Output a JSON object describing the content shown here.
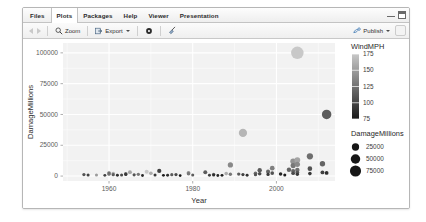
{
  "window": {
    "minimize_label": "minimize",
    "maximize_label": "maximize"
  },
  "tabs": [
    {
      "label": "Files",
      "active": false,
      "name": "tab-files"
    },
    {
      "label": "Plots",
      "active": true,
      "name": "tab-plots"
    },
    {
      "label": "Packages",
      "active": false,
      "name": "tab-packages"
    },
    {
      "label": "Help",
      "active": false,
      "name": "tab-help"
    },
    {
      "label": "Viewer",
      "active": false,
      "name": "tab-viewer"
    },
    {
      "label": "Presentation",
      "active": false,
      "name": "tab-presentation"
    }
  ],
  "toolbar": {
    "zoom_label": "Zoom",
    "export_label": "Export",
    "publish_label": "Publish",
    "icons": {
      "back": "left-arrow-icon",
      "forward": "right-arrow-icon",
      "zoom": "magnifier-icon",
      "export": "export-icon",
      "remove": "gear-icon",
      "clear": "broom-icon",
      "publish": "publish-icon"
    }
  },
  "chart_data": {
    "type": "scatter",
    "title": "",
    "xlabel": "Year",
    "ylabel": "DamageMillions",
    "xlim": [
      1949,
      2014
    ],
    "ylim": [
      -4000,
      108000
    ],
    "xticks": [
      1960,
      1980,
      2000
    ],
    "yticks": [
      0,
      25000,
      50000,
      75000,
      100000
    ],
    "ytick_labels": [
      "0",
      "25000",
      "50000",
      "75000",
      "100000"
    ],
    "xtick_labels": [
      "1960",
      "1980",
      "2000"
    ],
    "grid": true,
    "panel_background": "#f2f2f2",
    "grid_color": "#ffffff",
    "point_color_scale": "grey",
    "legends": [
      {
        "name": "colorbar",
        "title": "WindMPH",
        "type": "colorbar",
        "ticks": [
          175,
          150,
          125,
          100,
          75
        ],
        "tick_labels": [
          "175",
          "150",
          "125",
          "100",
          "75"
        ],
        "high_color": "#c8c8c8",
        "low_color": "#1a1a1a"
      },
      {
        "name": "size",
        "title": "DamageMillions",
        "type": "size",
        "breaks": [
          25000,
          50000,
          75000
        ],
        "break_labels": [
          "25000",
          "50000",
          "75000"
        ],
        "marker_color": "#161616"
      }
    ],
    "points": [
      {
        "x": 1954,
        "y": 1200,
        "wind": 110,
        "size": 1200
      },
      {
        "x": 1955,
        "y": 900,
        "wind": 100,
        "size": 900
      },
      {
        "x": 1957,
        "y": 800,
        "wind": 150,
        "size": 800
      },
      {
        "x": 1959,
        "y": 600,
        "wind": 100,
        "size": 600
      },
      {
        "x": 1960,
        "y": 1500,
        "wind": 140,
        "size": 1500
      },
      {
        "x": 1960,
        "y": 2400,
        "wind": 125,
        "size": 2400
      },
      {
        "x": 1961,
        "y": 2100,
        "wind": 160,
        "size": 2100
      },
      {
        "x": 1961,
        "y": 1100,
        "wind": 115,
        "size": 1100
      },
      {
        "x": 1962,
        "y": 700,
        "wind": 90,
        "size": 700
      },
      {
        "x": 1963,
        "y": 900,
        "wind": 105,
        "size": 900
      },
      {
        "x": 1964,
        "y": 1800,
        "wind": 120,
        "size": 1800
      },
      {
        "x": 1964,
        "y": 1300,
        "wind": 95,
        "size": 1300
      },
      {
        "x": 1965,
        "y": 3200,
        "wind": 155,
        "size": 3200
      },
      {
        "x": 1966,
        "y": 1000,
        "wind": 110,
        "size": 1000
      },
      {
        "x": 1967,
        "y": 1400,
        "wind": 130,
        "size": 1400
      },
      {
        "x": 1968,
        "y": 500,
        "wind": 85,
        "size": 500
      },
      {
        "x": 1969,
        "y": 3500,
        "wind": 175,
        "size": 3500
      },
      {
        "x": 1970,
        "y": 2200,
        "wind": 160,
        "size": 2200
      },
      {
        "x": 1971,
        "y": 800,
        "wind": 95,
        "size": 800
      },
      {
        "x": 1972,
        "y": 4200,
        "wind": 100,
        "size": 4200
      },
      {
        "x": 1973,
        "y": 600,
        "wind": 80,
        "size": 600
      },
      {
        "x": 1974,
        "y": 700,
        "wind": 90,
        "size": 700
      },
      {
        "x": 1975,
        "y": 1100,
        "wind": 115,
        "size": 1100
      },
      {
        "x": 1976,
        "y": 1200,
        "wind": 105,
        "size": 1200
      },
      {
        "x": 1977,
        "y": 400,
        "wind": 75,
        "size": 400
      },
      {
        "x": 1979,
        "y": 2600,
        "wind": 145,
        "size": 2600
      },
      {
        "x": 1979,
        "y": 1900,
        "wind": 130,
        "size": 1900
      },
      {
        "x": 1980,
        "y": 900,
        "wind": 115,
        "size": 900
      },
      {
        "x": 1983,
        "y": 3100,
        "wind": 115,
        "size": 3100
      },
      {
        "x": 1984,
        "y": 700,
        "wind": 100,
        "size": 700
      },
      {
        "x": 1985,
        "y": 1400,
        "wind": 120,
        "size": 1400
      },
      {
        "x": 1985,
        "y": 800,
        "wind": 90,
        "size": 800
      },
      {
        "x": 1986,
        "y": 500,
        "wind": 85,
        "size": 500
      },
      {
        "x": 1987,
        "y": 600,
        "wind": 80,
        "size": 600
      },
      {
        "x": 1988,
        "y": 2000,
        "wind": 160,
        "size": 2000
      },
      {
        "x": 1989,
        "y": 9000,
        "wind": 140,
        "size": 9000
      },
      {
        "x": 1989,
        "y": 1500,
        "wind": 130,
        "size": 1500
      },
      {
        "x": 1991,
        "y": 1600,
        "wind": 115,
        "size": 1600
      },
      {
        "x": 1992,
        "y": 35000,
        "wind": 165,
        "size": 35000
      },
      {
        "x": 1992,
        "y": 1200,
        "wind": 100,
        "size": 1200
      },
      {
        "x": 1993,
        "y": 700,
        "wind": 90,
        "size": 700
      },
      {
        "x": 1995,
        "y": 2200,
        "wind": 125,
        "size": 2200
      },
      {
        "x": 1995,
        "y": 1100,
        "wind": 110,
        "size": 1100
      },
      {
        "x": 1996,
        "y": 4800,
        "wind": 115,
        "size": 4800
      },
      {
        "x": 1996,
        "y": 1900,
        "wind": 105,
        "size": 1900
      },
      {
        "x": 1998,
        "y": 3600,
        "wind": 120,
        "size": 3600
      },
      {
        "x": 1998,
        "y": 1300,
        "wind": 95,
        "size": 1300
      },
      {
        "x": 1999,
        "y": 6400,
        "wind": 135,
        "size": 6400
      },
      {
        "x": 1999,
        "y": 2400,
        "wind": 110,
        "size": 2400
      },
      {
        "x": 2001,
        "y": 1700,
        "wind": 85,
        "size": 1700
      },
      {
        "x": 2002,
        "y": 900,
        "wind": 80,
        "size": 900
      },
      {
        "x": 2003,
        "y": 5200,
        "wind": 120,
        "size": 5200
      },
      {
        "x": 2004,
        "y": 12000,
        "wind": 145,
        "size": 12000
      },
      {
        "x": 2004,
        "y": 8500,
        "wind": 130,
        "size": 8500
      },
      {
        "x": 2004,
        "y": 4100,
        "wind": 120,
        "size": 4100
      },
      {
        "x": 2004,
        "y": 2300,
        "wind": 105,
        "size": 2300
      },
      {
        "x": 2005,
        "y": 100000,
        "wind": 175,
        "size": 100000
      },
      {
        "x": 2005,
        "y": 13000,
        "wind": 155,
        "size": 13000
      },
      {
        "x": 2005,
        "y": 9500,
        "wind": 140,
        "size": 9500
      },
      {
        "x": 2005,
        "y": 5000,
        "wind": 125,
        "size": 5000
      },
      {
        "x": 2005,
        "y": 2800,
        "wind": 110,
        "size": 2800
      },
      {
        "x": 2005,
        "y": 1400,
        "wind": 95,
        "size": 1400
      },
      {
        "x": 2008,
        "y": 16000,
        "wind": 125,
        "size": 16000
      },
      {
        "x": 2008,
        "y": 6000,
        "wind": 110,
        "size": 6000
      },
      {
        "x": 2008,
        "y": 2000,
        "wind": 95,
        "size": 2000
      },
      {
        "x": 2011,
        "y": 10000,
        "wind": 120,
        "size": 10000
      },
      {
        "x": 2011,
        "y": 3000,
        "wind": 100,
        "size": 3000
      },
      {
        "x": 2012,
        "y": 50000,
        "wind": 115,
        "size": 50000
      },
      {
        "x": 2012,
        "y": 2500,
        "wind": 90,
        "size": 2500
      }
    ]
  }
}
